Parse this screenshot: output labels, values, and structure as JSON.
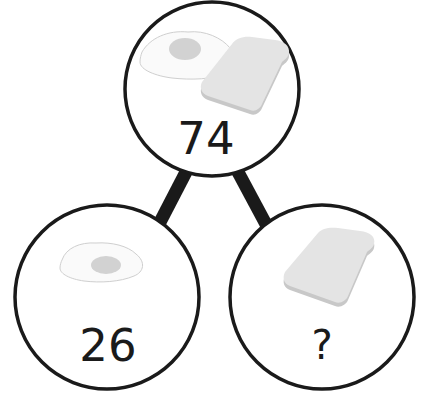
{
  "diagram": {
    "type": "part-whole-bar-model",
    "colors": {
      "outline": "#1a1a1a",
      "egg_white": "#fafafa",
      "egg_white_stroke": "#cfcfcf",
      "egg_yolk": "#d2d2d2",
      "toast": "#e4e4e4",
      "toast_crust": "#c8c8c8",
      "text": "#1a1a1a"
    },
    "whole": {
      "items": [
        "fried-egg",
        "toast"
      ],
      "value": "74"
    },
    "parts": [
      {
        "item": "fried-egg",
        "value": "26"
      },
      {
        "item": "toast",
        "value": "?"
      }
    ]
  }
}
